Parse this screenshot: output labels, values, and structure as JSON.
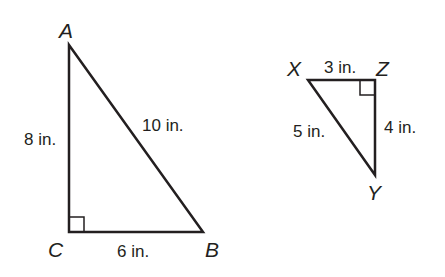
{
  "triangles": [
    {
      "name": "triangle-ABC",
      "vertices": {
        "A": {
          "label": "A",
          "x": 69,
          "y": 45
        },
        "B": {
          "label": "B",
          "x": 203,
          "y": 232
        },
        "C": {
          "label": "C",
          "x": 69,
          "y": 232
        }
      },
      "right_angle_at": "C",
      "sides": {
        "AC": "8 in.",
        "CB": "6 in.",
        "AB": "10 in."
      }
    },
    {
      "name": "triangle-XYZ",
      "vertices": {
        "X": {
          "label": "X",
          "x": 308,
          "y": 80
        },
        "Y": {
          "label": "Y",
          "x": 375,
          "y": 175
        },
        "Z": {
          "label": "Z",
          "x": 375,
          "y": 80
        }
      },
      "right_angle_at": "Z",
      "sides": {
        "XZ": "3 in.",
        "ZY": "4 in.",
        "XY": "5 in."
      }
    }
  ],
  "colors": {
    "stroke": "#231f20",
    "background": "#ffffff"
  }
}
